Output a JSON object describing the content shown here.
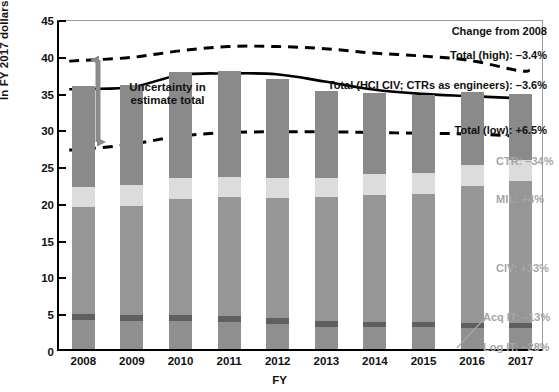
{
  "chart_data": {
    "type": "bar",
    "title": "",
    "xlabel": "FY",
    "ylabel": "In FY 2017 dollars (billions)",
    "ylim": [
      0,
      45
    ],
    "yticks": [
      0,
      5,
      10,
      15,
      20,
      25,
      30,
      35,
      40,
      45
    ],
    "grid": false,
    "legend_position": "right-inline",
    "categories": [
      "2008",
      "2009",
      "2010",
      "2011",
      "2012",
      "2013",
      "2014",
      "2015",
      "2016",
      "2017"
    ],
    "stacked": true,
    "series": [
      {
        "name": "Log IT",
        "values": [
          3.9,
          3.8,
          3.8,
          3.7,
          3.4,
          3.0,
          3.0,
          3.0,
          2.9,
          2.8
        ]
      },
      {
        "name": "Acq IT",
        "values": [
          0.8,
          0.8,
          0.8,
          0.8,
          0.8,
          0.8,
          0.7,
          0.7,
          0.7,
          0.7
        ]
      },
      {
        "name": "CIV",
        "values": [
          14.6,
          14.9,
          15.8,
          16.1,
          16.3,
          16.8,
          17.3,
          17.4,
          18.6,
          19.4
        ]
      },
      {
        "name": "MIL",
        "values": [
          2.7,
          2.8,
          2.8,
          2.8,
          2.8,
          2.7,
          2.8,
          2.8,
          2.8,
          2.8
        ]
      },
      {
        "name": "CTR",
        "values": [
          13.7,
          13.6,
          14.4,
          14.4,
          13.4,
          11.8,
          11.0,
          10.7,
          9.9,
          9.0
        ]
      }
    ],
    "bar_totals": [
      35.7,
      35.9,
      37.6,
      37.8,
      36.7,
      35.1,
      34.8,
      34.6,
      34.9,
      34.7
    ],
    "lines": [
      {
        "name": "Total (high)",
        "style": "dashed",
        "values": [
          39.6,
          40.0,
          40.9,
          41.5,
          41.5,
          41.2,
          40.6,
          40.2,
          39.6,
          38.2
        ]
      },
      {
        "name": "Total (HCI CIV; CTRs as engineers)",
        "style": "solid",
        "values": [
          35.7,
          35.9,
          37.6,
          37.8,
          37.7,
          36.7,
          35.6,
          35.0,
          34.7,
          34.4
        ]
      },
      {
        "name": "Total (low)",
        "style": "dashed",
        "values": [
          27.4,
          28.1,
          29.2,
          29.7,
          29.8,
          29.8,
          29.7,
          29.6,
          29.5,
          29.2
        ]
      }
    ],
    "annotations": {
      "change_header": "Change from 2008",
      "total_high": "Total (high): –3.4%",
      "total_mid": "Total (HCI CIV; CTRs as engineers): –3.6%",
      "total_low": "Total (low): +6.5%",
      "ctr": "CTR: –34%",
      "mil": "MIL: +4%",
      "civ": "CIV: +33%",
      "acq_it": "Acq IT: –13%",
      "log_it": "Log IT: –28%",
      "uncertainty_line1": "Uncertainty in",
      "uncertainty_line2": "estimate total"
    }
  },
  "colors": {
    "ctr": "#8a8a8a",
    "mil": "#dcdcdc",
    "civ": "#969696",
    "acq_it": "#5f5f5f",
    "log_it": "#8f8f8f",
    "line": "#000000",
    "arrow": "#8a8a8a",
    "legend_text": "#a6a6a6",
    "axis": "#000000"
  }
}
